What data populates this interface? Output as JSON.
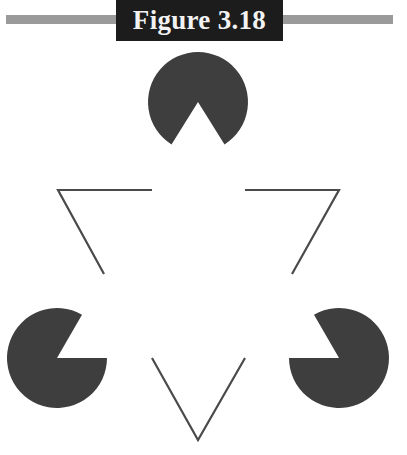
{
  "header": {
    "title": "Figure 3.18"
  },
  "figure": {
    "colors": {
      "shape_fill": "#3e3e3e",
      "line_stroke": "#4a4a4a",
      "title_bg": "#1c1c1c",
      "title_text": "#f2f2f2",
      "bar": "#9a9a9a"
    },
    "pacmen": [
      {
        "name": "top",
        "cx": 198,
        "cy": 102,
        "r": 50,
        "mouth": "down"
      },
      {
        "name": "bottom-left",
        "cx": 57,
        "cy": 358,
        "r": 50,
        "mouth": "upper-right"
      },
      {
        "name": "bottom-right",
        "cx": 339,
        "cy": 358,
        "r": 50,
        "mouth": "upper-left"
      }
    ],
    "line_segments": [
      {
        "name": "left-corner",
        "points": "152,190 58,190 104,274"
      },
      {
        "name": "right-corner",
        "points": "245,190 339,190 292,274"
      },
      {
        "name": "bottom-corner",
        "points": "152,358 198,440 245,358"
      }
    ]
  }
}
